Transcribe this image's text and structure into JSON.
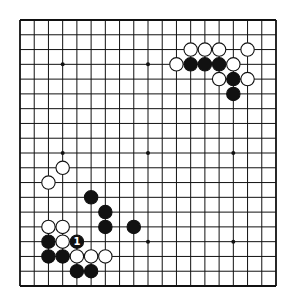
{
  "game": "go",
  "board": {
    "size": 19,
    "line_color": "#111111",
    "background": "#ffffff",
    "star_points": [
      [
        3,
        3
      ],
      [
        9,
        3
      ],
      [
        15,
        3
      ],
      [
        3,
        9
      ],
      [
        9,
        9
      ],
      [
        15,
        9
      ],
      [
        3,
        15
      ],
      [
        9,
        15
      ],
      [
        15,
        15
      ]
    ]
  },
  "stones": {
    "black": [
      [
        12,
        3
      ],
      [
        13,
        3
      ],
      [
        14,
        3
      ],
      [
        15,
        4
      ],
      [
        15,
        5
      ],
      [
        5,
        12
      ],
      [
        6,
        13
      ],
      [
        6,
        14
      ],
      [
        8,
        14
      ],
      [
        2,
        15
      ],
      [
        4,
        15
      ],
      [
        2,
        16
      ],
      [
        3,
        16
      ],
      [
        4,
        17
      ],
      [
        5,
        17
      ]
    ],
    "white": [
      [
        12,
        2
      ],
      [
        13,
        2
      ],
      [
        14,
        2
      ],
      [
        16,
        2
      ],
      [
        11,
        3
      ],
      [
        15,
        3
      ],
      [
        14,
        4
      ],
      [
        16,
        4
      ],
      [
        3,
        10
      ],
      [
        2,
        11
      ],
      [
        2,
        14
      ],
      [
        3,
        14
      ],
      [
        3,
        15
      ],
      [
        4,
        16
      ],
      [
        5,
        16
      ],
      [
        6,
        16
      ]
    ]
  },
  "labels": [
    {
      "col": 4,
      "row": 15,
      "text": "1",
      "on": "black"
    }
  ]
}
